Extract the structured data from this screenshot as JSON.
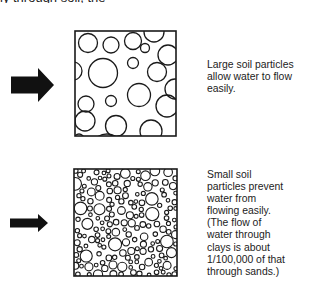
{
  "diagram": {
    "clipped_header_text": "ly through soil, the",
    "panels": [
      {
        "id": "large",
        "caption": "Large soil particles\nallow water to flow\neasily.",
        "caption_top": 59,
        "box": {
          "x": 75,
          "y": 31,
          "w": 101,
          "h": 105
        },
        "arrow": {
          "x": 11,
          "y": 68,
          "body_h": 17,
          "head_h": 34,
          "body_w": 27,
          "head_w": 16
        },
        "particles": [
          [
            13,
            12,
            9.5
          ],
          [
            36,
            14,
            8
          ],
          [
            58,
            10,
            8.5
          ],
          [
            79,
            1,
            10
          ],
          [
            70,
            17,
            4.5
          ],
          [
            93,
            24,
            10
          ],
          [
            28,
            42,
            14.5
          ],
          [
            58,
            32,
            5.5
          ],
          [
            82,
            41,
            9.5
          ],
          [
            -2,
            40,
            9
          ],
          [
            100,
            58,
            10
          ],
          [
            11,
            73,
            8
          ],
          [
            36,
            70,
            5.5
          ],
          [
            64,
            64,
            11.5
          ],
          [
            92,
            75,
            11
          ],
          [
            10,
            90,
            10
          ],
          [
            41,
            95,
            10.5
          ],
          [
            76,
            100,
            11
          ],
          [
            4,
            108,
            5
          ],
          [
            32,
            120,
            17
          ],
          [
            93,
            120,
            14
          ]
        ],
        "stroke": "#1a1a1a"
      },
      {
        "id": "small",
        "caption": "Small soil\nparticles prevent\nwater from\nflowing easily.\n(The flow of\nwater through\nclays is about\n1/100,000 of that\nthrough sands.)",
        "caption_top": 169,
        "box": {
          "x": 74,
          "y": 169,
          "w": 103,
          "h": 107
        },
        "arrow": {
          "x": 10,
          "y": 214,
          "body_h": 9,
          "head_h": 18,
          "body_w": 28,
          "head_w": 10
        },
        "particles": "generated",
        "stroke": "#1a1a1a"
      }
    ],
    "colors": {
      "ink": "#1a1a1a",
      "arrow_fill": "#111111",
      "background": "#ffffff"
    }
  }
}
